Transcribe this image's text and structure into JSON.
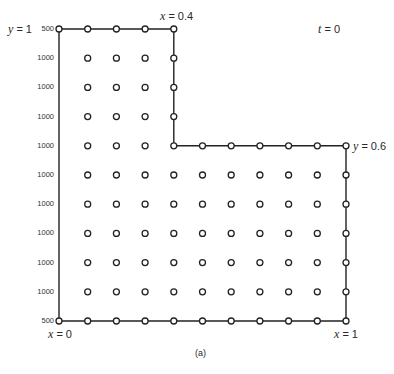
{
  "figure": {
    "caption": "(a)",
    "time_label": {
      "var": "t",
      "eq": " = 0"
    },
    "boundary_labels": [
      {
        "id": "y1",
        "var": "y",
        "eq": " = 1",
        "x": 8,
        "y": 23
      },
      {
        "id": "x04",
        "var": "x",
        "eq": " = 0.4",
        "x": 160,
        "y": 10
      },
      {
        "id": "y06",
        "var": "y",
        "eq": " = 0.6",
        "x": 353,
        "y": 140
      },
      {
        "id": "x0",
        "var": "x",
        "eq": " = 0",
        "x": 48,
        "y": 328
      },
      {
        "id": "x1",
        "var": "x",
        "eq": " = 1",
        "x": 334,
        "y": 328
      }
    ],
    "row_labels": [
      "500",
      "1000",
      "1000",
      "1000",
      "1000",
      "1000",
      "1000",
      "1000",
      "1000",
      "1000",
      "500"
    ],
    "grid": {
      "x0": 59,
      "dx": 28.7,
      "cols": 11,
      "y0": 29,
      "dy": 29.2,
      "rows": 11,
      "notch_col": 4,
      "notch_row": 4
    },
    "colors": {
      "line": "#222222",
      "node_fill": "#ffffff",
      "node_stroke": "#222222"
    }
  }
}
